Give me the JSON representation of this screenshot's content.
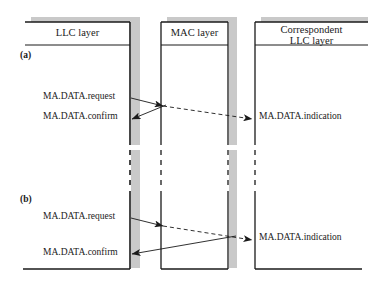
{
  "figure": {
    "kind": "sequence-diagram",
    "colors": {
      "line": "#1a1a1a",
      "shadow": "#c9c9c9",
      "background": "#ffffff"
    },
    "columns": [
      {
        "id": "llc",
        "title": "LLC layer",
        "title_lines": [
          "LLC layer"
        ]
      },
      {
        "id": "mac",
        "title": "MAC layer",
        "title_lines": [
          "MAC layer"
        ]
      },
      {
        "id": "peer",
        "title": "Correspondent LLC layer",
        "title_lines": [
          "Correspondent",
          "LLC layer"
        ]
      }
    ],
    "sections": [
      {
        "id": "a",
        "label": "(a)",
        "messages": [
          {
            "id": "a-request",
            "text": "MA.DATA.request"
          },
          {
            "id": "a-confirm",
            "text": "MA.DATA.confirm"
          },
          {
            "id": "a-indication",
            "text": "MA.DATA.indication"
          }
        ]
      },
      {
        "id": "b",
        "label": "(b)",
        "messages": [
          {
            "id": "b-request",
            "text": "MA.DATA.request"
          },
          {
            "id": "b-confirm",
            "text": "MA.DATA.confirm"
          },
          {
            "id": "b-indication",
            "text": "MA.DATA.indication"
          }
        ]
      }
    ]
  }
}
